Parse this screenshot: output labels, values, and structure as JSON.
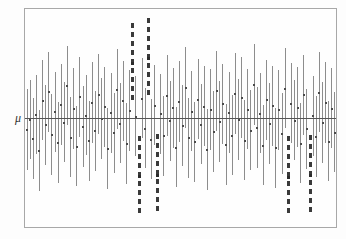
{
  "figure": {
    "type": "confidence-interval-coverage-plot",
    "width": 346,
    "height": 239,
    "background_color": "#fdfdfd",
    "frame": {
      "x": 24,
      "y": 8,
      "width": 313,
      "height": 220,
      "border_color": "#a8a8a8",
      "fill_color": "#fefefe"
    },
    "axis_label_mu": "μ",
    "reference_line": {
      "label": "μ",
      "y": 111,
      "color": "#555555"
    },
    "colors": {
      "interval_line": "#8d8d8d",
      "miss_interval_line": "#3a3a3a",
      "center_point": "#4a4a4a",
      "frame": "#a8a8a8",
      "reference_line": "#555555",
      "background": "#fdfdfd"
    }
  },
  "chart_data": {
    "type": "line",
    "title": "",
    "subtitle": "",
    "xlabel": "",
    "ylabel": "",
    "tick_labels_x": [],
    "tick_labels_y": [
      "μ"
    ],
    "grid": false,
    "legend": [],
    "legend_position": "none",
    "annotations": [
      {
        "text": "μ",
        "x": 8,
        "y": 118,
        "role": "axis-label"
      }
    ],
    "axis_ranges": {
      "x": [
        0,
        100
      ],
      "y": [
        -3.2,
        3.2
      ]
    },
    "mu_value": 0,
    "n_intervals": 100,
    "n_misses": 6,
    "coverage_percent": 94,
    "series": [
      {
        "name": "confidence intervals",
        "columns": [
          "index",
          "center",
          "lower",
          "upper",
          "covers_mu"
        ],
        "values": [
          [
            1,
            -0.34,
            -1.52,
            0.84,
            true
          ],
          [
            2,
            -0.05,
            -1.21,
            1.11,
            true
          ],
          [
            3,
            -0.6,
            -1.79,
            0.59,
            true
          ],
          [
            4,
            0.1,
            -1.05,
            1.25,
            true
          ],
          [
            5,
            -0.95,
            -2.14,
            0.24,
            true
          ],
          [
            6,
            0.52,
            -0.66,
            1.7,
            true
          ],
          [
            7,
            -0.2,
            -1.38,
            0.98,
            true
          ],
          [
            8,
            0.77,
            -0.4,
            1.94,
            true
          ],
          [
            9,
            -0.48,
            -1.66,
            0.7,
            true
          ],
          [
            10,
            0.18,
            -1.0,
            1.36,
            true
          ],
          [
            11,
            -0.72,
            -1.9,
            0.46,
            true
          ],
          [
            12,
            0.4,
            -0.78,
            1.58,
            true
          ],
          [
            13,
            -0.12,
            -1.3,
            1.06,
            true
          ],
          [
            14,
            0.95,
            -0.22,
            2.12,
            true
          ],
          [
            15,
            -0.56,
            -1.74,
            0.62,
            true
          ],
          [
            16,
            0.28,
            -0.9,
            1.46,
            true
          ],
          [
            17,
            -0.83,
            -2.01,
            0.35,
            true
          ],
          [
            18,
            0.62,
            -0.56,
            1.8,
            true
          ],
          [
            19,
            -0.25,
            -1.43,
            0.93,
            true
          ],
          [
            20,
            0.08,
            -1.1,
            1.26,
            true
          ],
          [
            21,
            -0.67,
            -1.85,
            0.51,
            true
          ],
          [
            22,
            0.45,
            -0.73,
            1.63,
            true
          ],
          [
            23,
            -0.38,
            -1.56,
            0.8,
            true
          ],
          [
            24,
            0.7,
            -0.48,
            1.88,
            true
          ],
          [
            25,
            -0.02,
            -1.2,
            1.16,
            true
          ],
          [
            26,
            0.33,
            -0.85,
            1.51,
            true
          ],
          [
            27,
            -0.9,
            -2.08,
            0.28,
            true
          ],
          [
            28,
            0.15,
            -1.03,
            1.33,
            true
          ],
          [
            29,
            -0.44,
            -1.62,
            0.74,
            true
          ],
          [
            30,
            0.85,
            -0.33,
            2.03,
            true
          ],
          [
            31,
            -0.15,
            -1.33,
            1.03,
            true
          ],
          [
            32,
            0.5,
            -0.68,
            1.68,
            true
          ],
          [
            33,
            -0.75,
            -1.93,
            0.43,
            true
          ],
          [
            34,
            0.22,
            -0.96,
            1.4,
            true
          ],
          [
            35,
            1.62,
            0.44,
            2.8,
            false
          ],
          [
            36,
            0.05,
            -1.13,
            1.23,
            true
          ],
          [
            37,
            -1.7,
            -2.88,
            -0.52,
            false
          ],
          [
            38,
            0.58,
            -0.6,
            1.76,
            true
          ],
          [
            39,
            -0.3,
            -1.48,
            0.88,
            true
          ],
          [
            40,
            1.75,
            0.57,
            2.93,
            false
          ],
          [
            41,
            -0.62,
            -1.8,
            0.56,
            true
          ],
          [
            42,
            0.38,
            -0.8,
            1.56,
            true
          ],
          [
            43,
            -1.66,
            -2.84,
            -0.48,
            false
          ],
          [
            44,
            0.12,
            -1.06,
            1.3,
            true
          ],
          [
            45,
            -0.52,
            -1.7,
            0.66,
            true
          ],
          [
            46,
            0.66,
            -0.52,
            1.84,
            true
          ],
          [
            47,
            -0.08,
            -1.26,
            1.1,
            true
          ],
          [
            48,
            0.3,
            -0.88,
            1.48,
            true
          ],
          [
            49,
            -0.86,
            -2.04,
            0.32,
            true
          ],
          [
            50,
            0.48,
            -0.7,
            1.66,
            true
          ],
          [
            51,
            -0.22,
            -1.4,
            0.96,
            true
          ],
          [
            52,
            0.9,
            -0.28,
            2.08,
            true
          ],
          [
            53,
            -0.58,
            -1.76,
            0.6,
            true
          ],
          [
            54,
            0.2,
            -0.98,
            1.38,
            true
          ],
          [
            55,
            -0.7,
            -1.88,
            0.48,
            true
          ],
          [
            56,
            0.55,
            -0.63,
            1.73,
            true
          ],
          [
            57,
            -0.18,
            -1.36,
            1.0,
            true
          ],
          [
            58,
            0.35,
            -0.83,
            1.53,
            true
          ],
          [
            59,
            -0.92,
            -2.1,
            0.26,
            true
          ],
          [
            60,
            0.25,
            -0.93,
            1.43,
            true
          ],
          [
            61,
            -0.4,
            -1.58,
            0.78,
            true
          ],
          [
            62,
            0.8,
            -0.38,
            1.98,
            true
          ],
          [
            63,
            -0.1,
            -1.28,
            1.08,
            true
          ],
          [
            64,
            0.42,
            -0.76,
            1.6,
            true
          ],
          [
            65,
            -0.78,
            -1.96,
            0.4,
            true
          ],
          [
            66,
            0.16,
            -1.02,
            1.34,
            true
          ],
          [
            67,
            -0.5,
            -1.68,
            0.68,
            true
          ],
          [
            68,
            0.72,
            -0.46,
            1.9,
            true
          ],
          [
            69,
            -0.04,
            -1.22,
            1.14,
            true
          ],
          [
            70,
            0.6,
            -0.58,
            1.78,
            true
          ],
          [
            71,
            -0.65,
            -1.83,
            0.53,
            true
          ],
          [
            72,
            0.26,
            -0.92,
            1.44,
            true
          ],
          [
            73,
            -0.36,
            -1.54,
            0.82,
            true
          ],
          [
            74,
            0.98,
            -0.2,
            2.16,
            true
          ],
          [
            75,
            -0.28,
            -1.46,
            0.9,
            true
          ],
          [
            76,
            0.14,
            -1.04,
            1.32,
            true
          ],
          [
            77,
            -0.8,
            -1.98,
            0.38,
            true
          ],
          [
            78,
            0.53,
            -0.65,
            1.71,
            true
          ],
          [
            79,
            -0.16,
            -1.34,
            1.02,
            true
          ],
          [
            80,
            0.36,
            -0.82,
            1.54,
            true
          ],
          [
            81,
            -0.88,
            -2.06,
            0.3,
            true
          ],
          [
            82,
            0.24,
            -0.94,
            1.42,
            true
          ],
          [
            83,
            -0.46,
            -1.64,
            0.72,
            true
          ],
          [
            84,
            0.88,
            -0.3,
            2.06,
            true
          ],
          [
            85,
            -1.72,
            -2.9,
            -0.54,
            false
          ],
          [
            86,
            0.44,
            -0.74,
            1.62,
            true
          ],
          [
            87,
            -0.06,
            -1.24,
            1.12,
            true
          ],
          [
            88,
            0.32,
            -0.86,
            1.5,
            true
          ],
          [
            89,
            -0.74,
            -1.92,
            0.44,
            true
          ],
          [
            90,
            0.68,
            -0.5,
            1.86,
            true
          ],
          [
            91,
            -0.32,
            -1.5,
            0.86,
            true
          ],
          [
            92,
            -1.68,
            -2.86,
            -0.5,
            false
          ],
          [
            93,
            0.06,
            -1.12,
            1.24,
            true
          ],
          [
            94,
            -0.54,
            -1.72,
            0.64,
            true
          ],
          [
            95,
            0.76,
            -0.42,
            1.94,
            true
          ],
          [
            96,
            -0.13,
            -1.31,
            1.05,
            true
          ],
          [
            97,
            0.46,
            -0.72,
            1.64,
            true
          ],
          [
            98,
            -0.68,
            -1.86,
            0.5,
            true
          ],
          [
            99,
            0.29,
            -0.89,
            1.47,
            true
          ],
          [
            100,
            -0.42,
            -1.6,
            0.76,
            true
          ]
        ]
      }
    ]
  }
}
